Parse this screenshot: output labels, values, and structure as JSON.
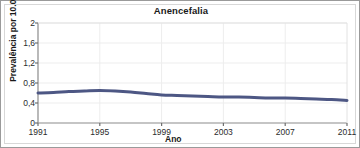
{
  "figure": {
    "title": "Anencefalia",
    "border_color": "#9a9a9a",
    "background": "#ffffff"
  },
  "axes": {
    "x_title": "Ano",
    "y_title": "Prevalência por 10.000"
  },
  "chart_data": {
    "type": "line",
    "title": "Anencefalia",
    "xlabel": "Ano",
    "ylabel": "Prevalência por 10.000",
    "xlim": [
      1991,
      2011
    ],
    "ylim": [
      0,
      2
    ],
    "grid": true,
    "legend": null,
    "line_color": "#4d5784",
    "line_width": 3,
    "x_ticks": [
      1991,
      1995,
      1999,
      2003,
      2007,
      2011
    ],
    "x_tick_labels": [
      "1991",
      "1995",
      "1999",
      "2003",
      "2007",
      "2011"
    ],
    "y_ticks": [
      0,
      0.4,
      0.8,
      1.2,
      1.6,
      2
    ],
    "y_tick_labels": [
      "0",
      "0,4",
      "0,8",
      "1,2",
      "1,6",
      "2"
    ],
    "x": [
      1991,
      1992,
      1993,
      1994,
      1995,
      1996,
      1997,
      1998,
      1999,
      2000,
      2001,
      2002,
      2003,
      2004,
      2005,
      2006,
      2007,
      2008,
      2009,
      2010,
      2011
    ],
    "series": [
      {
        "name": "Prevalência",
        "values": [
          0.6,
          0.61,
          0.63,
          0.64,
          0.65,
          0.64,
          0.62,
          0.59,
          0.56,
          0.55,
          0.54,
          0.53,
          0.52,
          0.52,
          0.51,
          0.5,
          0.5,
          0.49,
          0.48,
          0.47,
          0.45
        ]
      }
    ]
  }
}
